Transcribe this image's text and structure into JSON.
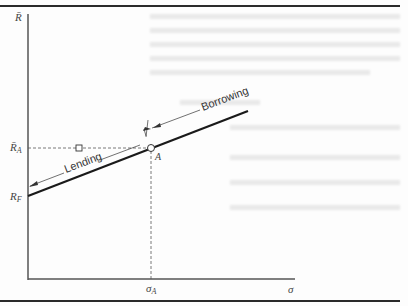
{
  "figure": {
    "y_axis_label": "R̄",
    "x_axis_label": "σ",
    "rf_label": "R",
    "rf_sub": "F",
    "ra_label": "R̄",
    "ra_sub": "A",
    "sigma_a_label": "σ",
    "sigma_a_sub": "A",
    "point_label": "A",
    "lending_label": "Lending",
    "borrowing_label": "Borrowing"
  },
  "colors": {
    "line": "#1a1a1a",
    "axis": "#555555",
    "border": "#2a2a2a"
  }
}
